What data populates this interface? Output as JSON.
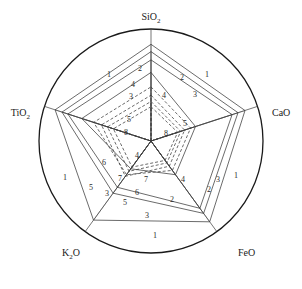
{
  "chart_data": {
    "type": "radar",
    "title": "",
    "subtitle": "",
    "xlabel": "",
    "ylabel": "",
    "grid": false,
    "legend_position": "inline-curve-labels",
    "outer_boundary": "circle",
    "axis_count": 5,
    "axes": [
      {
        "name": "SiO2",
        "label": "SiO",
        "sub": "2",
        "angle_deg": 90
      },
      {
        "name": "CaO",
        "label": "CaO",
        "sub": "",
        "angle_deg": 18
      },
      {
        "name": "FeO",
        "label": "FeO",
        "sub": "",
        "angle_deg": -54
      },
      {
        "name": "K2O",
        "label": "K",
        "sub": "2",
        "label_tail": "O",
        "angle_deg": -126
      },
      {
        "name": "TiO2",
        "label": "TiO",
        "sub": "2",
        "angle_deg": 162
      }
    ],
    "categories": [
      "SiO2",
      "CaO",
      "FeO",
      "K2O",
      "TiO2"
    ],
    "radial_range": [
      0,
      1
    ],
    "series": [
      {
        "name": "1",
        "label": "1",
        "style": "solid",
        "values": [
          0.93,
          0.95,
          0.96,
          0.94,
          0.97
        ]
      },
      {
        "name": "2",
        "label": "2",
        "style": "solid",
        "values": [
          0.86,
          0.88,
          0.86,
          0.62,
          0.9
        ]
      },
      {
        "name": "3",
        "label": "3",
        "style": "solid",
        "values": [
          0.78,
          0.82,
          0.8,
          0.55,
          0.84
        ]
      },
      {
        "name": "4",
        "label": "4",
        "style": "solid",
        "values": [
          0.66,
          0.45,
          0.4,
          0.33,
          0.7
        ]
      },
      {
        "name": "5",
        "label": "5",
        "style": "dashed",
        "values": [
          0.52,
          0.4,
          0.35,
          0.4,
          0.58
        ]
      },
      {
        "name": "6",
        "label": "6",
        "style": "dashed",
        "values": [
          0.44,
          0.34,
          0.3,
          0.42,
          0.5
        ]
      },
      {
        "name": "7",
        "label": "7",
        "style": "dashed",
        "values": [
          0.38,
          0.3,
          0.26,
          0.36,
          0.44
        ]
      },
      {
        "name": "8",
        "label": "8",
        "style": "dashed",
        "values": [
          0.33,
          0.27,
          0.23,
          0.31,
          0.38
        ]
      }
    ],
    "curve_labels": [
      {
        "text": "1",
        "x": 109,
        "y": 77
      },
      {
        "text": "2",
        "x": 140,
        "y": 71
      },
      {
        "text": "4",
        "x": 133,
        "y": 87
      },
      {
        "text": "3",
        "x": 131,
        "y": 99
      },
      {
        "text": "2",
        "x": 182,
        "y": 80
      },
      {
        "text": "1",
        "x": 207,
        "y": 77
      },
      {
        "text": "3",
        "x": 195,
        "y": 97
      },
      {
        "text": "4",
        "x": 164,
        "y": 98
      },
      {
        "text": "5",
        "x": 129,
        "y": 122
      },
      {
        "text": "8",
        "x": 126,
        "y": 135
      },
      {
        "text": "5",
        "x": 185,
        "y": 126
      },
      {
        "text": "8",
        "x": 166,
        "y": 136
      },
      {
        "text": "4",
        "x": 137,
        "y": 158
      },
      {
        "text": "4",
        "x": 183,
        "y": 182
      },
      {
        "text": "1",
        "x": 65,
        "y": 180
      },
      {
        "text": "5",
        "x": 91,
        "y": 190
      },
      {
        "text": "6",
        "x": 104,
        "y": 165
      },
      {
        "text": "3",
        "x": 107,
        "y": 196
      },
      {
        "text": "7",
        "x": 120,
        "y": 181
      },
      {
        "text": "7",
        "x": 146,
        "y": 182
      },
      {
        "text": "6",
        "x": 137,
        "y": 195
      },
      {
        "text": "5",
        "x": 125,
        "y": 205
      },
      {
        "text": "2",
        "x": 172,
        "y": 202
      },
      {
        "text": "2",
        "x": 209,
        "y": 192
      },
      {
        "text": "3",
        "x": 218,
        "y": 182
      },
      {
        "text": "1",
        "x": 236,
        "y": 178
      },
      {
        "text": "3",
        "x": 147,
        "y": 218
      },
      {
        "text": "1",
        "x": 155,
        "y": 238
      }
    ]
  },
  "geometry": {
    "center_x": 151,
    "center_y": 141,
    "outer_radius": 112,
    "axis_unit_radius": 104
  },
  "style": {
    "stroke_color": "#3a3a3a",
    "circle_color": "#1a1a1a",
    "background": "#ffffff",
    "dash_pattern": "3,2"
  }
}
